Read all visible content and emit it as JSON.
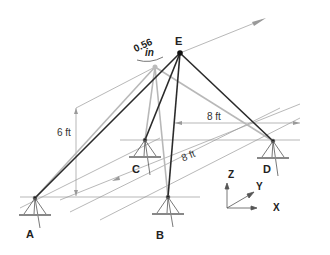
{
  "figure": {
    "type": "3D tripod/space frame with displaced apex",
    "colors": {
      "member": "#2a2a2a",
      "original_member": "#b5b5b5",
      "dimension": "#8a8a8a",
      "background": "#ffffff"
    },
    "points": {
      "A": {
        "label": "A"
      },
      "B": {
        "label": "B"
      },
      "C": {
        "label": "C"
      },
      "D": {
        "label": "D"
      },
      "E": {
        "label": "E"
      }
    },
    "dimensions": {
      "height": "6 ft",
      "width_cd": "8 ft",
      "depth_cb": "8 ft",
      "displacement_value": "0.56",
      "displacement_unit": "in"
    },
    "axes": {
      "x": "X",
      "y": "Y",
      "z": "Z"
    }
  }
}
